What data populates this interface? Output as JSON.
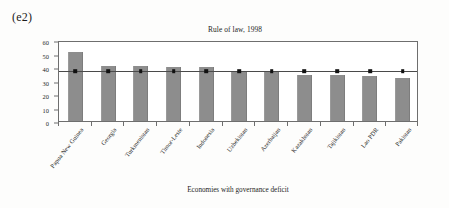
{
  "panel": {
    "label": "(e2)"
  },
  "chart_data": {
    "type": "bar",
    "title": "Rule of law, 1998",
    "xlabel": "Economies with governance deficit",
    "ylabel": "Gini coefficient",
    "ylim": [
      0,
      60
    ],
    "yticks": [
      0,
      10,
      20,
      30,
      40,
      50,
      60
    ],
    "grid": false,
    "legend": null,
    "categories": [
      "Papua New Guinea",
      "Georgia",
      "Turkmenistan",
      "Timor-Leste",
      "Indonesia",
      "Uzbekistan",
      "Azerbaijan",
      "Kazakhstan",
      "Tajikistan",
      "Lao PDR",
      "Pakistan"
    ],
    "series": [
      {
        "name": "Gini coefficient",
        "type": "bar",
        "values": [
          51.0,
          40.5,
          40.5,
          39.7,
          39.7,
          36.8,
          36.7,
          34.1,
          33.9,
          33.1,
          31.5
        ]
      },
      {
        "name": "Reference level",
        "type": "line",
        "values": [
          38.3,
          38.3,
          38.3,
          38.3,
          38.3,
          38.3,
          38.3,
          38.3,
          38.3,
          38.3,
          38.3
        ]
      }
    ],
    "colors": {
      "bar_fill": "#8d8d8d",
      "line": "#4a4a4a",
      "marker": "#111111",
      "axis": "#6e6e6e",
      "text": "#1d1d1d",
      "background": "#ffffff"
    }
  }
}
